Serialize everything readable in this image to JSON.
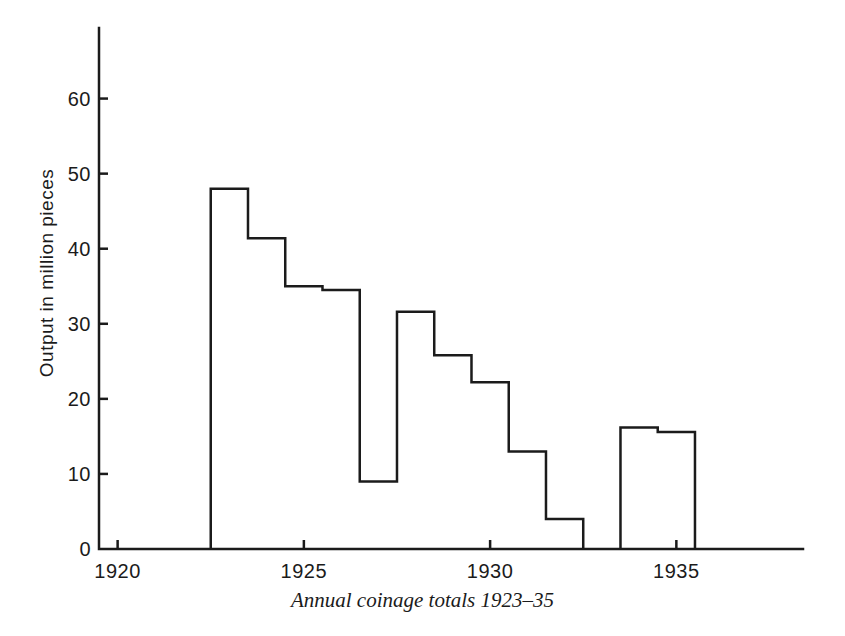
{
  "chart_data": {
    "type": "bar",
    "subtype": "step-outline-histogram",
    "title": "Annual coinage totals 1923–35",
    "xlabel": "",
    "ylabel": "Output in million pieces",
    "categories": [
      1923,
      1924,
      1925,
      1926,
      1927,
      1928,
      1929,
      1930,
      1931,
      1932,
      1933,
      1934,
      1935
    ],
    "values": [
      48,
      41.4,
      35,
      34.5,
      9,
      31.6,
      25.8,
      22.2,
      13,
      4,
      null,
      16.2,
      15.6
    ],
    "series": [
      {
        "name": "Annual coinage output (million pieces)",
        "values": [
          48,
          41.4,
          35,
          34.5,
          9,
          31.6,
          25.8,
          22.2,
          13,
          4,
          null,
          16.2,
          15.6
        ]
      }
    ],
    "bar_width_years": 1,
    "gap_years": [
      1933
    ],
    "xlim": [
      1919.5,
      1938.4
    ],
    "ylim": [
      0,
      69.4
    ],
    "xticks": [
      1920,
      1925,
      1930,
      1935
    ],
    "yticks": [
      0,
      10,
      20,
      30,
      40,
      50,
      60
    ],
    "grid": "off",
    "legend": "none",
    "line_color": "#1b1b1b",
    "background_color": "#ffffff"
  }
}
